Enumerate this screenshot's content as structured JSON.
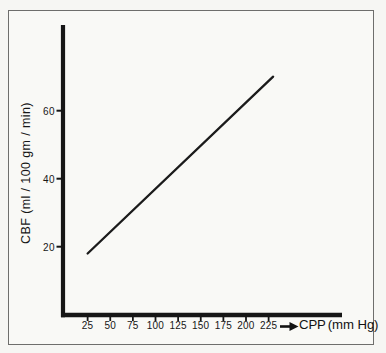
{
  "figure": {
    "background_color": "#f9f9f6",
    "frame_color": "#6e6e6c",
    "ink_color": "#161616"
  },
  "chart_data": {
    "type": "line",
    "title": "",
    "x_axis": {
      "label": "CPP",
      "units": "(mm Hg)",
      "ticks": [
        25,
        50,
        75,
        100,
        125,
        150,
        175,
        200,
        225
      ],
      "range": [
        0,
        305
      ]
    },
    "y_axis": {
      "label": "CBF (ml / 100 gm / min)",
      "ticks": [
        20,
        40,
        60
      ],
      "range": [
        0,
        85
      ]
    },
    "series": [
      {
        "name": "CBF vs CPP (pressure-passive line)",
        "points": [
          [
            25,
            18
          ],
          [
            230,
            70
          ]
        ]
      }
    ],
    "grid": false,
    "legend": false
  }
}
